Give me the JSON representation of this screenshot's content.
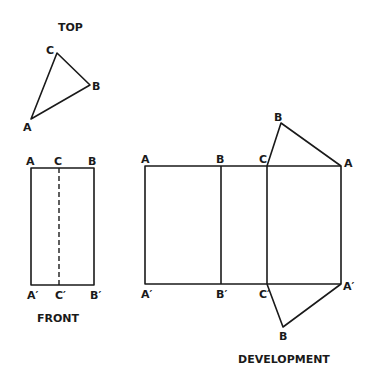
{
  "views": {
    "top": {
      "title": "TOP",
      "labels": {
        "a": "A",
        "b": "B",
        "c": "C"
      }
    },
    "front": {
      "title": "FRONT",
      "top_labels": {
        "a": "A",
        "c": "C",
        "b": "B"
      },
      "bottom_labels": {
        "a": "A′",
        "c": "C′",
        "b": "B′"
      }
    },
    "development": {
      "title": "DEVELOPMENT",
      "top_labels": {
        "a": "A",
        "b": "B",
        "c": "C",
        "a2": "A"
      },
      "bottom_labels": {
        "a": "A′",
        "b": "B′",
        "c": "C′",
        "a2": "A′"
      },
      "top_flap_apex": "B",
      "bottom_flap_apex": "B"
    }
  }
}
